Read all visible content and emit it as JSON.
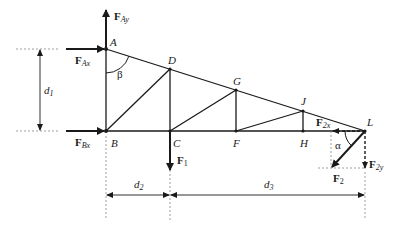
{
  "diagram": {
    "type": "truss-free-body-diagram",
    "nodes": {
      "A": {
        "label": "A"
      },
      "B": {
        "label": "B"
      },
      "C": {
        "label": "C"
      },
      "D": {
        "label": "D"
      },
      "F": {
        "label": "F"
      },
      "G": {
        "label": "G"
      },
      "H": {
        "label": "H"
      },
      "J": {
        "label": "J"
      },
      "L": {
        "label": "L"
      }
    },
    "forces": {
      "FAy": {
        "main": "F",
        "sub": "Ay"
      },
      "FAx": {
        "main": "F",
        "sub": "Ax"
      },
      "FBx": {
        "main": "F",
        "sub": "Bx"
      },
      "F1": {
        "main": "F",
        "sub": "1"
      },
      "F2": {
        "main": "F",
        "sub": "2"
      },
      "F2x": {
        "main": "F",
        "sub": "2x"
      },
      "F2y": {
        "main": "F",
        "sub": "2y"
      }
    },
    "angles": {
      "beta": "β",
      "alpha": "α"
    },
    "dimensions": {
      "d1": {
        "main": "d",
        "sub": "1"
      },
      "d2": {
        "main": "d",
        "sub": "2"
      },
      "d3": {
        "main": "d",
        "sub": "3"
      }
    }
  }
}
